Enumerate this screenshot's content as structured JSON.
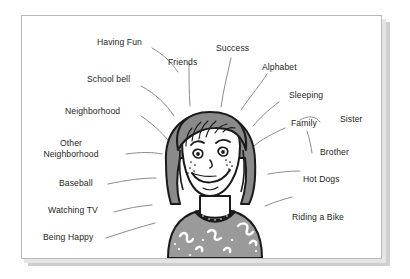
{
  "figure": {
    "type": "concept-map-illustration",
    "caption_text": "",
    "center_subject": "smiling girl with bob haircut and freckles",
    "background_color": "#ffffff",
    "card_color": "#ffffff",
    "card_border_color": "#b9b9b9",
    "shadow_color": "#cfcfcf",
    "text_color": "#231f20",
    "connector_color": "#8c8c8c",
    "hair_color": "#8a8a8a",
    "skin_color": "#ffffff",
    "shirt_color": "#9a9a9a"
  },
  "labels": {
    "having_fun": "Having Fun",
    "friends": "Friends",
    "success": "Success",
    "alphabet": "Alphabet",
    "school_bell": "School bell",
    "sleeping": "Sleeping",
    "neighborhood": "Neighborhood",
    "family": "Family",
    "sister": "Sister",
    "other_neighborhood": "Other Neighborhood",
    "brother": "Brother",
    "baseball": "Baseball",
    "hot_dogs": "Hot Dogs",
    "watching_tv": "Watching TV",
    "riding_a_bike": "Riding a Bike",
    "being_happy": "Being Happy"
  },
  "label_list": [
    "Having Fun",
    "Friends",
    "Success",
    "Alphabet",
    "School bell",
    "Sleeping",
    "Neighborhood",
    "Family",
    "Sister",
    "Other Neighborhood",
    "Brother",
    "Baseball",
    "Hot Dogs",
    "Watching TV",
    "Riding a Bike",
    "Being Happy"
  ],
  "counts": {
    "total_labels": 16
  }
}
